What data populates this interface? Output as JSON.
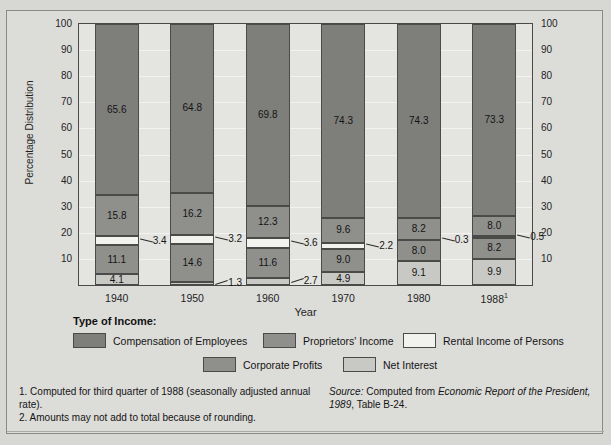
{
  "chart_data": {
    "type": "bar",
    "subtype": "stacked-100-percent",
    "title": "",
    "xlabel": "Year",
    "ylabel": "Percentage Distribution",
    "ylim": [
      0,
      100
    ],
    "yticks": [
      10,
      20,
      30,
      40,
      50,
      60,
      70,
      80,
      90,
      100
    ],
    "grid": true,
    "dual_axis": true,
    "legend_position": "below-plot",
    "categories": [
      "1940",
      "1950",
      "1960",
      "1970",
      "1980",
      "1988"
    ],
    "category_labels": [
      "1940",
      "1950",
      "1960",
      "1970",
      "1980",
      "1988¹"
    ],
    "series": [
      {
        "name": "Net Interest",
        "values": [
          4.1,
          1.3,
          2.7,
          4.9,
          9.1,
          9.9
        ],
        "color": "#c8c8c5"
      },
      {
        "name": "Corporate Profits",
        "values": [
          11.1,
          14.6,
          11.6,
          9.0,
          8.0,
          8.2
        ],
        "color": "#8f8f8c"
      },
      {
        "name": "Rental Income of Persons",
        "values": [
          3.4,
          3.2,
          3.6,
          2.2,
          0.3,
          0.5
        ],
        "color": "#f2f2ef"
      },
      {
        "name": "Proprietors' Income",
        "values": [
          15.8,
          16.2,
          12.3,
          9.6,
          8.2,
          8.0
        ],
        "color": "#8f8f8c"
      },
      {
        "name": "Compensation of Employees",
        "values": [
          65.6,
          64.8,
          69.8,
          74.3,
          74.3,
          73.3
        ],
        "color": "#7e7e7b"
      }
    ]
  },
  "axes": {
    "ylabel": "Percentage Distribution",
    "xlabel": "Year",
    "left_ticks": [
      "100",
      "90",
      "80",
      "70",
      "60",
      "50",
      "40",
      "30",
      "20",
      "10"
    ],
    "right_ticks": [
      "100",
      "90",
      "80",
      "70",
      "60",
      "50",
      "40",
      "30",
      "20",
      "10"
    ]
  },
  "legend": {
    "title": "Type of Income:",
    "items": [
      {
        "label": "Compensation of Employees",
        "color": "#7e7e7b"
      },
      {
        "label": "Proprietors' Income",
        "color": "#8f8f8c"
      },
      {
        "label": "Rental Income of Persons",
        "color": "#f2f2ef"
      },
      {
        "label": "Corporate Profits",
        "color": "#8f8f8c"
      },
      {
        "label": "Net Interest",
        "color": "#c8c8c5"
      }
    ]
  },
  "notes": {
    "footnote_1": "1. Computed for third quarter of 1988 (seasonally adjusted annual rate).",
    "footnote_2": "2. Amounts may not add to total because of rounding.",
    "source_label": "Source:",
    "source_text_1": " Computed from ",
    "source_italic": "Economic Report of the President, 1989",
    "source_text_2": ", Table B-24."
  }
}
